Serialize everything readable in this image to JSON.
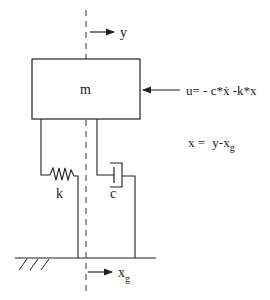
{
  "diagram": {
    "type": "base-excited mass-spring-damper with feedback control",
    "mass_label": "m",
    "spring_label": "k",
    "damper_label": "c",
    "displacement_label": "y",
    "ground_displacement_label": {
      "base": "x",
      "sub": "g"
    },
    "control_law": "u= - c*ẋ -k*x",
    "relative_displacement": {
      "lhs": "x = ",
      "rhs_base": "y-x",
      "rhs_sub": "g"
    }
  },
  "colors": {
    "stroke": "#222222",
    "background": "#ffffff"
  }
}
